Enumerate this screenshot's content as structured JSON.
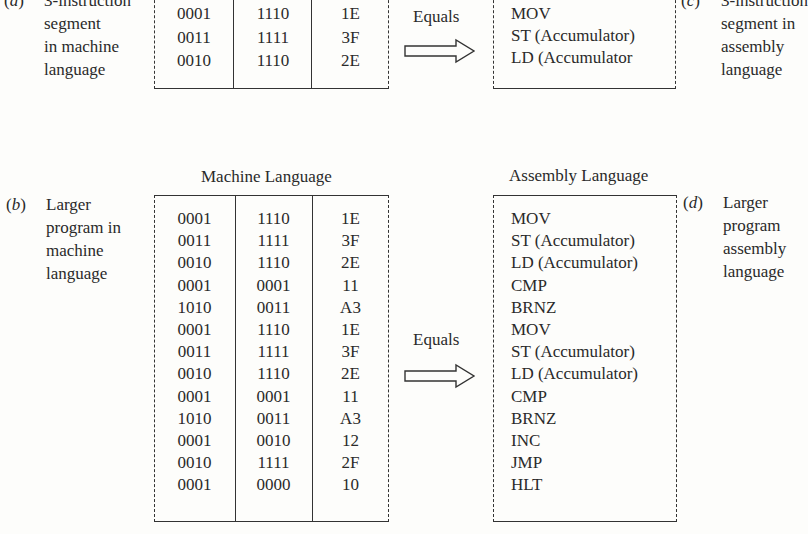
{
  "panel_a": {
    "tag": "(a)",
    "lines": [
      "3-instruction",
      "segment",
      "in machine",
      "language"
    ],
    "rows": [
      [
        "0001",
        "1110",
        "1E"
      ],
      [
        "0011",
        "1111",
        "3F"
      ],
      [
        "0010",
        "1110",
        "2E"
      ]
    ]
  },
  "panel_c": {
    "tag": "(c)",
    "lines": [
      "3-instruction",
      "segment in",
      "assembly",
      "language"
    ],
    "items": [
      "MOV",
      "ST (Accumulator)",
      "LD (Accumulator"
    ]
  },
  "equals_top": "Equals",
  "panel_b": {
    "tag": "(b)",
    "lines": [
      "Larger",
      "program in",
      "machine",
      "language"
    ],
    "title": "Machine Language",
    "rows": [
      [
        "0001",
        "1110",
        "1E"
      ],
      [
        "0011",
        "1111",
        "3F"
      ],
      [
        "0010",
        "1110",
        "2E"
      ],
      [
        "0001",
        "0001",
        "11"
      ],
      [
        "1010",
        "0011",
        "A3"
      ],
      [
        "0001",
        "1110",
        "1E"
      ],
      [
        "0011",
        "1111",
        "3F"
      ],
      [
        "0010",
        "1110",
        "2E"
      ],
      [
        "0001",
        "0001",
        "11"
      ],
      [
        "1010",
        "0011",
        "A3"
      ],
      [
        "0001",
        "0010",
        "12"
      ],
      [
        "0010",
        "1111",
        "2F"
      ],
      [
        "0001",
        "0000",
        "10"
      ]
    ]
  },
  "equals_bottom": "Equals",
  "panel_d": {
    "tag": "(d)",
    "lines": [
      "Larger",
      "program",
      "assembly",
      "language"
    ],
    "title": "Assembly Language",
    "items": [
      "MOV",
      "ST (Accumulator)",
      "LD (Accumulator)",
      "CMP",
      "BRNZ",
      "MOV",
      "ST (Accumulator)",
      "LD (Accumulator)",
      "CMP",
      "BRNZ",
      "INC",
      "JMP",
      "HLT"
    ]
  },
  "icons": {
    "arrow": "right-hollow-arrow-icon"
  }
}
